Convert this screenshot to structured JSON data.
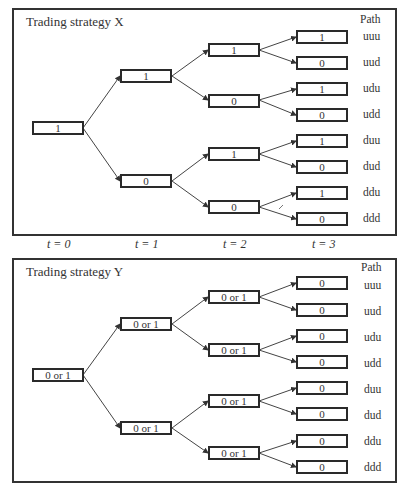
{
  "time_labels": [
    "t = 0",
    "t = 1",
    "t = 2",
    "t = 3"
  ],
  "path_header": "Path",
  "paths": [
    "uuu",
    "uud",
    "udu",
    "udd",
    "duu",
    "dud",
    "ddu",
    "ddd"
  ],
  "strategy_x": {
    "title": "Trading strategy X",
    "t0": [
      "1"
    ],
    "t1": [
      "1",
      "0"
    ],
    "t2": [
      "1",
      "0",
      "1",
      "0"
    ],
    "t3": [
      "1",
      "0",
      "1",
      "0",
      "1",
      "0",
      "1",
      "0"
    ]
  },
  "strategy_y": {
    "title": "Trading strategy Y",
    "t0": [
      "0 or 1"
    ],
    "t1": [
      "0 or 1",
      "0 or 1"
    ],
    "t2": [
      "0 or 1",
      "0 or 1",
      "0 or 1",
      "0 or 1"
    ],
    "t3": [
      "0",
      "0",
      "0",
      "0",
      "0",
      "0",
      "0",
      "0"
    ]
  }
}
